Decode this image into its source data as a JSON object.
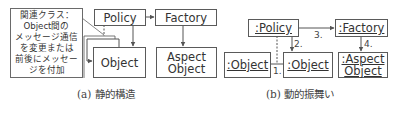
{
  "diagram_a": {
    "note": {
      "lines": [
        "関連クラス：",
        "Object間の",
        "メッセージ通信",
        "を変更または",
        "前後にメッセー",
        "ジを付加"
      ]
    },
    "policy": "Policy",
    "factory": "Factory",
    "object": "Object",
    "aspect_object": [
      "Aspect",
      "Object"
    ],
    "caption": "(a) 静的構造"
  },
  "diagram_b": {
    "policy": ":Policy",
    "factory": ":Factory",
    "object_left": ":Object",
    "object_center": ":Object",
    "aspect_object": [
      ":Aspect",
      "Object"
    ],
    "labels": {
      "step1": "1.",
      "step2": "2.",
      "step3": "3.",
      "step4": "4."
    },
    "caption": "(b) 動的振舞い"
  },
  "colors": {
    "line": "#5a5a5a",
    "text": "#333333",
    "background": "#ffffff"
  }
}
